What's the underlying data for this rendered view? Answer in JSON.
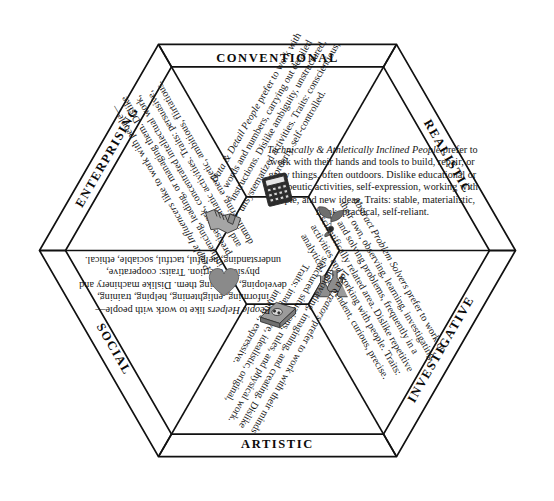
{
  "figure": {
    "type": "hexagon-model",
    "title_visible": false,
    "background": "#ffffff",
    "line_color": "#111111"
  },
  "segments": [
    {
      "id": "realistic",
      "band_label": "REALISTIC",
      "position": "top",
      "lead": "Technically & Athletically Inclined People",
      "body": " prefer to work with their hands and tools to build, repair, or grow things, often outdoors. Dislike educational or therapeutic activities, self-expression, working with people, and new ideas. Traits: stable, materialistic, frank, practical, self-reliant.",
      "icon": "plant-sprout-icon",
      "rotation_deg": 0
    },
    {
      "id": "investigative",
      "band_label": "INVESTIGATIVE",
      "position": "top-right",
      "lead": "Abstract Problem Solvers",
      "body": " prefer to work on their own, observing, learning, investigating, and solving problems, frequently in a scientifically related area. Dislike repetitive activities and working with people. Traits: analytical, independent, curious, precise.",
      "icon": "laboratory-flasks-icon",
      "rotation_deg": 60
    },
    {
      "id": "artistic",
      "band_label": "ARTISTIC",
      "position": "bottom-right",
      "lead": "Idea Creators",
      "body": " prefer to work with their minds—innovating, imagining, and creating. Dislike structured situations, rules, and physical work. Traits: imaginative, idealistic, original, intuitive, expressive.",
      "icon": "book-palette-icon",
      "rotation_deg": 120
    },
    {
      "id": "social",
      "band_label": "SOCIAL",
      "position": "bottom",
      "lead": "People Helpers",
      "body": " like to work with people—informing, enlightening, helping, training, developing, or curing them. Dislike machinery and physical exertion. Traits: cooperative, understanding, helpful, tactful, sociable, ethical.",
      "icon": "heart-icon",
      "rotation_deg": 180
    },
    {
      "id": "enterprising",
      "band_label": "ENTERPRISING",
      "position": "bottom-left",
      "lead": "People Influencers",
      "body": " like to work with people—influencing, leading, or managing them. Dislike precise work, concentrated intellectual work, and systematic activities. Traits: persuasive, domineering, energetic, ambitious, flirtatious.",
      "icon": "handshake-icon",
      "rotation_deg": 240
    },
    {
      "id": "conventional",
      "band_label": "CONVENTIONAL",
      "position": "top-left",
      "lead": "Data & Detail People",
      "body": " prefer to work with words and numbers, carrying out detailed instructions. Dislike ambiguity, unstructured, unsystematized activities. Traits: conscientious, orderly, self-controlled.",
      "icon": "calculator-icon",
      "rotation_deg": 300
    }
  ]
}
